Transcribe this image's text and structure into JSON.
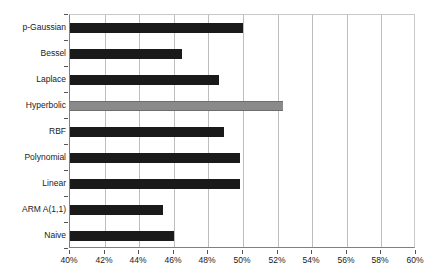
{
  "chart_data": {
    "type": "bar",
    "orientation": "horizontal",
    "title": "",
    "subtitle": "",
    "xlabel": "",
    "ylabel": "",
    "xlim": [
      40,
      60
    ],
    "xtick_step": 2,
    "grid": "vertical",
    "legend": "none",
    "value_suffix": "%",
    "categories": [
      "p-Gaussian",
      "Bessel",
      "Laplace",
      "Hyperbolic",
      "RBF",
      "Polynomial",
      "Linear",
      "ARM A(1,1)",
      "Naive"
    ],
    "values": [
      50.0,
      46.5,
      48.6,
      52.3,
      48.9,
      49.8,
      49.8,
      45.4,
      46.0
    ],
    "bar_colors": [
      "#1a1a1a",
      "#1a1a1a",
      "#1a1a1a",
      "#8a8a8a",
      "#1a1a1a",
      "#1a1a1a",
      "#1a1a1a",
      "#1a1a1a",
      "#1a1a1a"
    ],
    "highlight_category": "Hyperbolic",
    "xticks": [
      40,
      42,
      44,
      46,
      48,
      50,
      52,
      54,
      56,
      58,
      60
    ],
    "xtick_labels": [
      "40%",
      "42%",
      "44%",
      "46%",
      "48%",
      "50%",
      "52%",
      "54%",
      "56%",
      "58%",
      "60%"
    ]
  },
  "colors": {
    "bar_default": "#1a1a1a",
    "bar_highlight": "#8a8a8a",
    "gridline": "#bdbdbd",
    "axis": "#808080",
    "text": "#1a1a1a",
    "background": "#ffffff"
  }
}
